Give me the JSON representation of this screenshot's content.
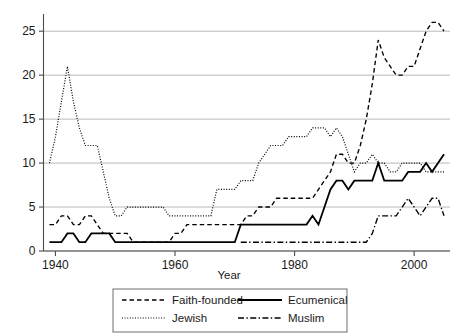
{
  "figure": {
    "name": "line-chart-religious-ngo-founding",
    "background": "#ffffff",
    "line_color": "#000000",
    "grid_color": "#b9b9b9",
    "axis_color": "#4d4d4d"
  },
  "axes": {
    "x": {
      "label": "Year",
      "ticks": [
        1940,
        1960,
        1980,
        2000
      ],
      "tick_labels": [
        "1940",
        "1960",
        "1980",
        "2000"
      ],
      "range": [
        1938,
        2006
      ]
    },
    "y": {
      "label": "",
      "ticks": [
        0,
        5,
        10,
        15,
        20,
        25
      ],
      "tick_labels": [
        "0",
        "5",
        "10",
        "15",
        "20",
        "25"
      ],
      "range": [
        0,
        26.5
      ]
    },
    "grid": "horizontal"
  },
  "legend": {
    "position": "below-axis",
    "entries": [
      {
        "label": "Faith-founded",
        "style": "dashed",
        "key": "faith_founded"
      },
      {
        "label": "Ecumenical",
        "style": "solid",
        "key": "ecumenical"
      },
      {
        "label": "Jewish",
        "style": "dotted",
        "key": "jewish"
      },
      {
        "label": "Muslim",
        "style": "dash-dot",
        "key": "muslim"
      }
    ]
  },
  "chart_data": {
    "type": "line",
    "title": "",
    "xlabel": "Year",
    "ylabel": "",
    "xlim": [
      1938,
      2006
    ],
    "ylim": [
      0,
      26.5
    ],
    "grid": true,
    "legend_position": "bottom",
    "x": [
      1939,
      1940,
      1941,
      1942,
      1943,
      1944,
      1945,
      1946,
      1947,
      1948,
      1949,
      1950,
      1951,
      1952,
      1953,
      1954,
      1955,
      1956,
      1957,
      1958,
      1959,
      1960,
      1961,
      1962,
      1963,
      1964,
      1965,
      1966,
      1967,
      1968,
      1969,
      1970,
      1971,
      1972,
      1973,
      1974,
      1975,
      1976,
      1977,
      1978,
      1979,
      1980,
      1981,
      1982,
      1983,
      1984,
      1985,
      1986,
      1987,
      1988,
      1989,
      1990,
      1991,
      1992,
      1993,
      1994,
      1995,
      1996,
      1997,
      1998,
      1999,
      2000,
      2001,
      2002,
      2003,
      2004,
      2005
    ],
    "series": [
      {
        "name": "Faith-founded",
        "style": "dashed",
        "values": [
          3,
          3,
          4,
          4,
          3,
          3,
          4,
          4,
          3,
          2,
          2,
          2,
          2,
          2,
          1,
          1,
          1,
          1,
          1,
          1,
          1,
          2,
          2,
          3,
          3,
          3,
          3,
          3,
          3,
          3,
          3,
          3,
          3,
          4,
          4,
          5,
          5,
          5,
          6,
          6,
          6,
          6,
          6,
          6,
          6,
          7,
          8,
          9,
          11,
          11,
          10,
          10,
          12,
          15,
          19,
          24,
          22,
          21,
          20,
          20,
          21,
          21,
          23,
          25,
          26,
          26,
          25
        ]
      },
      {
        "name": "Ecumenical",
        "style": "solid",
        "values": [
          1,
          1,
          1,
          2,
          2,
          1,
          1,
          2,
          2,
          2,
          2,
          1,
          1,
          1,
          1,
          1,
          1,
          1,
          1,
          1,
          1,
          1,
          1,
          1,
          1,
          1,
          1,
          1,
          1,
          1,
          1,
          1,
          3,
          3,
          3,
          3,
          3,
          3,
          3,
          3,
          3,
          3,
          3,
          3,
          4,
          3,
          5,
          7,
          8,
          8,
          7,
          8,
          8,
          8,
          8,
          10,
          8,
          8,
          8,
          8,
          9,
          9,
          9,
          10,
          9,
          10,
          11
        ]
      },
      {
        "name": "Jewish",
        "style": "dotted",
        "values": [
          10,
          13,
          17,
          21,
          17,
          14,
          12,
          12,
          12,
          9,
          6,
          4,
          4,
          5,
          5,
          5,
          5,
          5,
          5,
          5,
          4,
          4,
          4,
          4,
          4,
          4,
          4,
          4,
          7,
          7,
          7,
          7,
          8,
          8,
          8,
          10,
          11,
          12,
          12,
          12,
          13,
          13,
          13,
          13,
          14,
          14,
          14,
          13,
          14,
          13,
          11,
          9,
          10,
          10,
          11,
          10,
          10,
          9,
          9,
          10,
          10,
          10,
          10,
          9,
          9,
          9,
          9
        ]
      },
      {
        "name": "Muslim",
        "style": "dash-dot",
        "values": [
          0,
          0,
          0,
          0,
          0,
          0,
          0,
          0,
          0,
          0,
          0,
          0,
          0,
          0,
          0,
          0,
          0,
          0,
          0,
          0,
          0,
          0,
          0,
          0,
          0,
          0,
          0,
          0,
          0,
          0,
          0,
          0,
          1,
          1,
          1,
          1,
          1,
          1,
          1,
          1,
          1,
          1,
          1,
          1,
          1,
          1,
          1,
          1,
          1,
          1,
          1,
          1,
          1,
          1,
          2,
          4,
          4,
          4,
          4,
          5,
          6,
          5,
          4,
          5,
          6,
          6,
          4
        ]
      }
    ]
  }
}
